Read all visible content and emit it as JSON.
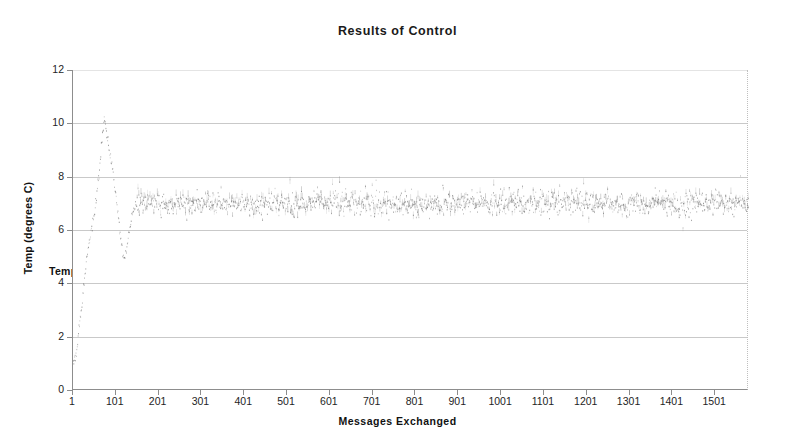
{
  "chart_data": {
    "type": "scatter",
    "title": "Results of Control",
    "xlabel": "Messages Exchanged",
    "ylabel": "Temp (degrees C)",
    "legend": [
      "Temp (degrees C)"
    ],
    "legend_position": "overlapping-left-axis",
    "grid": true,
    "xlim": [
      1,
      1580
    ],
    "ylim": [
      0,
      12
    ],
    "yticks": [
      0,
      2,
      4,
      6,
      8,
      10,
      12
    ],
    "xticks": [
      1,
      101,
      201,
      301,
      401,
      501,
      601,
      701,
      801,
      901,
      1001,
      1101,
      1201,
      1301,
      1401,
      1501
    ],
    "series": [
      {
        "name": "Temp (degrees C)",
        "marker": "dot",
        "color": "#6e6e6e",
        "description": "Step-response of a temperature control loop: rises from ~1.1 C at message 1, overshoots to ~10.2 C near message 70, undershoots to ~5.0 C near message 115, then settles into a noisy steady state around 7.0 C (band roughly 6.2-7.9 C) for the remainder.",
        "keypoints": [
          {
            "x": 1,
            "y": 1.1
          },
          {
            "x": 8,
            "y": 1.2
          },
          {
            "x": 14,
            "y": 2.4
          },
          {
            "x": 20,
            "y": 3.1
          },
          {
            "x": 26,
            "y": 4.0
          },
          {
            "x": 32,
            "y": 4.9
          },
          {
            "x": 38,
            "y": 5.6
          },
          {
            "x": 44,
            "y": 6.1
          },
          {
            "x": 50,
            "y": 6.6
          },
          {
            "x": 56,
            "y": 7.4
          },
          {
            "x": 62,
            "y": 8.3
          },
          {
            "x": 66,
            "y": 9.0
          },
          {
            "x": 70,
            "y": 9.6
          },
          {
            "x": 74,
            "y": 10.2
          },
          {
            "x": 80,
            "y": 9.5
          },
          {
            "x": 86,
            "y": 8.9
          },
          {
            "x": 92,
            "y": 8.3
          },
          {
            "x": 98,
            "y": 7.6
          },
          {
            "x": 104,
            "y": 6.8
          },
          {
            "x": 110,
            "y": 5.9
          },
          {
            "x": 116,
            "y": 5.1
          },
          {
            "x": 122,
            "y": 5.0
          },
          {
            "x": 128,
            "y": 5.6
          },
          {
            "x": 134,
            "y": 6.2
          },
          {
            "x": 140,
            "y": 6.7
          },
          {
            "x": 148,
            "y": 7.0
          },
          {
            "x": 160,
            "y": 7.1
          },
          {
            "x": 200,
            "y": 7.0
          },
          {
            "x": 400,
            "y": 7.0
          },
          {
            "x": 700,
            "y": 7.0
          },
          {
            "x": 1000,
            "y": 7.0
          },
          {
            "x": 1300,
            "y": 7.0
          },
          {
            "x": 1575,
            "y": 7.0
          }
        ],
        "steady_state": {
          "from_x": 150,
          "to_x": 1575,
          "mean": 7.0,
          "low": 6.2,
          "high": 7.9
        }
      }
    ]
  },
  "colors": {
    "series": "#6e6e6e",
    "axis": "#8d8d8d",
    "grid": "#c9c9c9",
    "text": "#1a1a1a",
    "background": "#ffffff"
  }
}
